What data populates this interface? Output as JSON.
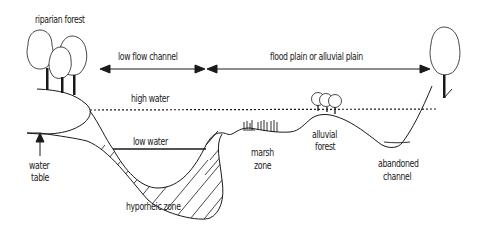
{
  "diagram": {
    "type": "river cross-section",
    "labels": {
      "riparian_forest": "riparian forest",
      "low_flow_channel": "low flow channel",
      "flood_plain": "flood plain or alluvial plain",
      "high_water": "high water",
      "low_water": "low water",
      "water_table_1": "water",
      "water_table_2": "table",
      "marsh_zone_1": "marsh",
      "marsh_zone_2": "zone",
      "alluvial_forest_1": "alluvial",
      "alluvial_forest_2": "forest",
      "abandoned_channel_1": "abandoned",
      "abandoned_channel_2": "channel",
      "hyporheic_zone": "hyporheic zone"
    },
    "colors": {
      "ink": "#1a1a1a",
      "background": "#ffffff"
    }
  }
}
